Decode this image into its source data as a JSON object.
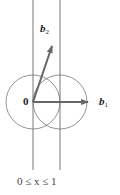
{
  "figure": {
    "origin_label": "0",
    "vectors": [
      {
        "name": "b",
        "subscript": "1",
        "from": [
          33,
          102
        ],
        "to": [
          88,
          102
        ]
      },
      {
        "name": "b",
        "subscript": "2",
        "from": [
          33,
          102
        ],
        "to": [
          52,
          46
        ]
      }
    ],
    "circles": [
      {
        "center": [
          33,
          102
        ],
        "radius": 27
      },
      {
        "center": [
          60,
          102
        ],
        "radius": 27
      }
    ],
    "strip_lines_x": [
      33,
      60
    ],
    "strip_label": "0 ≤ x ≤ 1",
    "colors": {
      "vector": "#666666",
      "line": "#555555",
      "text": "#222222"
    }
  }
}
